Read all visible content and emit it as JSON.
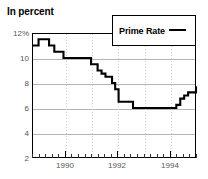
{
  "chart_data": {
    "type": "line",
    "title": "In percent",
    "xlabel": "",
    "ylabel": "",
    "ylim": [
      2,
      12
    ],
    "xlim": [
      1988.75,
      1995.0
    ],
    "grid": true,
    "legend_position": "top-right",
    "y_ticks": [
      {
        "value": 12,
        "label": "12%"
      },
      {
        "value": 10,
        "label": "10"
      },
      {
        "value": 8,
        "label": "8"
      },
      {
        "value": 6,
        "label": "6"
      },
      {
        "value": 4,
        "label": "4"
      },
      {
        "value": 2,
        "label": "2"
      }
    ],
    "x_ticks": [
      {
        "value": 1990,
        "label": "1990"
      },
      {
        "value": 1992,
        "label": "1992"
      },
      {
        "value": 1994,
        "label": "1994"
      }
    ],
    "x_minor_tick_interval": 0.25,
    "series": [
      {
        "name": "Prime Rate",
        "color": "#000000",
        "style": "step",
        "x": [
          1988.75,
          1989.0,
          1989.15,
          1989.4,
          1989.6,
          1989.95,
          1990.8,
          1991.0,
          1991.1,
          1991.25,
          1991.4,
          1991.55,
          1991.7,
          1991.8,
          1991.92,
          1992.05,
          1992.45,
          1992.6,
          1994.05,
          1994.25,
          1994.4,
          1994.55,
          1994.7,
          1994.85,
          1995.0
        ],
        "y": [
          11.0,
          11.5,
          11.5,
          11.0,
          10.5,
          10.0,
          10.0,
          9.5,
          9.5,
          9.0,
          8.75,
          8.5,
          8.5,
          8.0,
          7.5,
          6.5,
          6.5,
          6.0,
          6.0,
          6.25,
          6.75,
          7.0,
          7.25,
          7.25,
          7.75
        ]
      }
    ],
    "legend": [
      {
        "label": "Prime Rate",
        "color": "#000000"
      }
    ]
  },
  "legend": {
    "label": "Prime Rate"
  },
  "axis": {
    "y_label_0": "12%",
    "y_label_1": "10",
    "y_label_2": "8",
    "y_label_3": "6",
    "y_label_4": "4",
    "y_label_5": "2",
    "x_label_0": "1990",
    "x_label_1": "1992",
    "x_label_2": "1994"
  }
}
